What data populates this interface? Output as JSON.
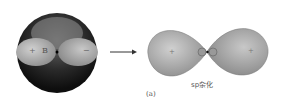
{
  "left_figure": {
    "labels": {
      "plus": "+",
      "atom": "B",
      "minus": "−"
    }
  },
  "arrow": {
    "symbol": "→"
  },
  "right_figure": {
    "caption": "sp杂化",
    "panel_label": "(a)",
    "lobe_signs": {
      "left": "+",
      "right": "+"
    }
  },
  "colors": {
    "sphere_dark": "#1a1a1a",
    "lobe_light": "#b5b5b5",
    "lobe_mid": "#9a9a9a"
  }
}
